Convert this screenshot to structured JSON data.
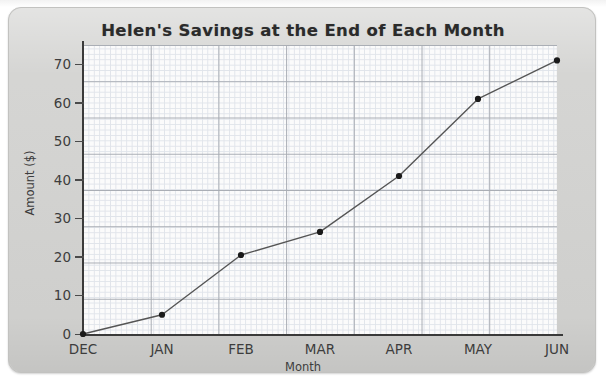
{
  "chart_data": {
    "type": "line",
    "title": "Helen's Savings at the End of Each Month",
    "xlabel": "Month",
    "ylabel": "Amount ($)",
    "categories": [
      "DEC",
      "JAN",
      "FEB",
      "MAR",
      "APR",
      "MAY",
      "JUN"
    ],
    "values": [
      0,
      5,
      20.5,
      26.5,
      41,
      61,
      71
    ],
    "ylim": [
      0,
      75
    ],
    "y_ticks": [
      0,
      10,
      20,
      30,
      40,
      50,
      60,
      70
    ],
    "y_tick_labels": [
      "0",
      "10",
      "20",
      "30",
      "40",
      "50",
      "60",
      "70"
    ],
    "grid": true,
    "minor_grid": true,
    "legend": "none",
    "marker": "circle",
    "line_color": "#555555",
    "marker_color": "#1a1a1a",
    "grid_color_major": "#a9adb4",
    "grid_color_minor": "#dfe3ea",
    "plot_background": "#fbfbfb",
    "panel_background": "#d3d3d1",
    "text_color": "#3d3d3d",
    "title_color": "#2b2b2b"
  }
}
